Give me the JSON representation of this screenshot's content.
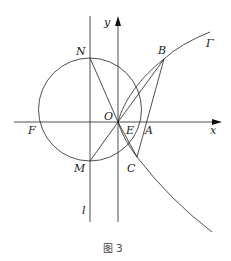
{
  "figure": {
    "caption": "图 3",
    "curve_label": "Γ",
    "axes": {
      "x_label": "x",
      "y_label": "y"
    },
    "line_label": "l",
    "points": {
      "O": "O",
      "N": "N",
      "M": "M",
      "B": "B",
      "C": "C",
      "A": "A",
      "E": "E",
      "F": "F"
    }
  }
}
